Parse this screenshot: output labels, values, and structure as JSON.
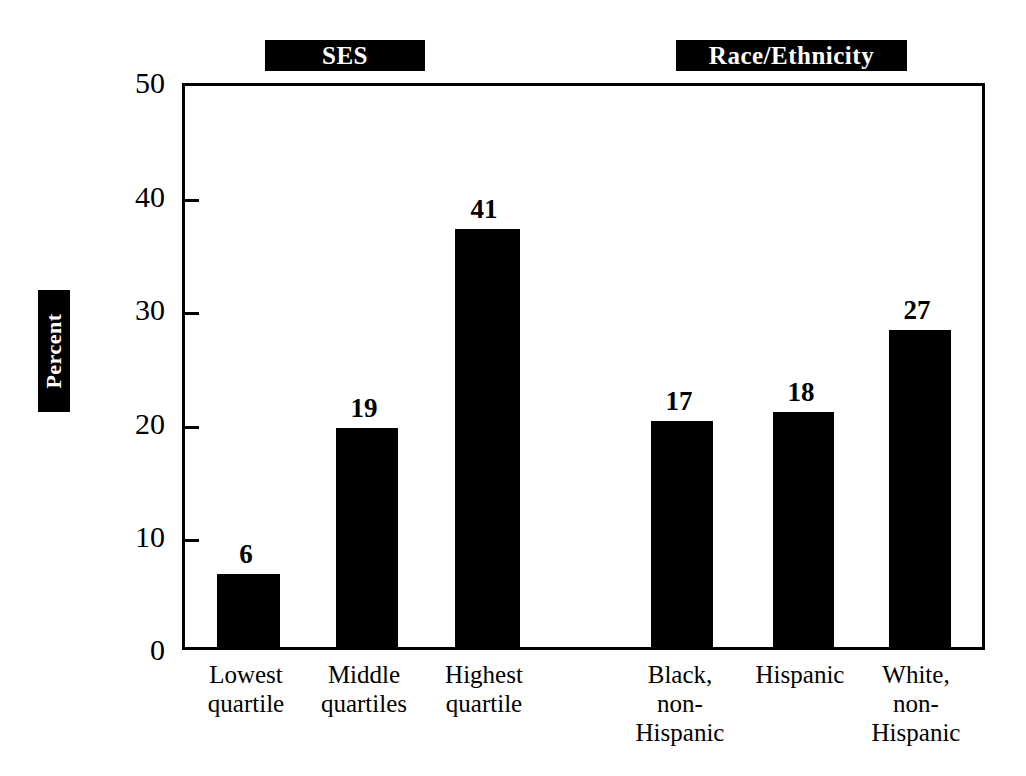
{
  "chart_data": {
    "type": "bar",
    "title": "",
    "xlabel": "",
    "ylabel": "Percent",
    "ylim": [
      0,
      50
    ],
    "yticks": [
      0,
      10,
      20,
      30,
      40,
      50
    ],
    "grid": false,
    "legend_position": "none",
    "group_headers": [
      {
        "label": "SES"
      },
      {
        "label": "Race/Ethnicity"
      }
    ],
    "categories": [
      "Lowest quartile",
      "Middle quartiles",
      "Highest quartile",
      "Black, non-Hispanic",
      "Hispanic",
      "White, non-Hispanic"
    ],
    "category_lines": [
      [
        "Lowest",
        "quartile"
      ],
      [
        "Middle",
        "quartiles"
      ],
      [
        "Highest",
        "quartile"
      ],
      [
        "Black,",
        "non-",
        "Hispanic"
      ],
      [
        "Hispanic"
      ],
      [
        "White,",
        "non-",
        "Hispanic"
      ]
    ],
    "values": [
      6,
      19,
      41,
      17,
      18,
      27
    ],
    "value_labels": [
      "6",
      "19",
      "41",
      "17",
      "18",
      "27"
    ],
    "bar_color": "#000000",
    "bars": [
      {
        "label": "Lowest quartile",
        "value": 6,
        "value_label": "6",
        "x": 214,
        "width": 63,
        "top": 577,
        "label_x": 205,
        "label_width": 82,
        "label_top": 541
      },
      {
        "label": "Middle quartiles",
        "value": 19,
        "value_label": "19",
        "x": 333,
        "width": 62,
        "top": 431,
        "label_x": 323,
        "label_width": 82,
        "label_top": 395
      },
      {
        "label": "Highest quartile",
        "value": 41,
        "value_label": "41",
        "x": 452,
        "width": 65,
        "top": 232,
        "label_x": 443,
        "label_width": 82,
        "label_top": 196
      },
      {
        "label": "Black, non-Hispanic",
        "value": 17,
        "value_label": "17",
        "x": 648,
        "width": 62,
        "top": 424,
        "label_x": 638,
        "label_width": 82,
        "label_top": 388
      },
      {
        "label": "Hispanic",
        "value": 18,
        "value_label": "18",
        "x": 770,
        "width": 61,
        "top": 415,
        "label_x": 760,
        "label_width": 82,
        "label_top": 379
      },
      {
        "label": "White, non-Hispanic",
        "value": 27,
        "value_label": "27",
        "x": 886,
        "width": 62,
        "top": 333,
        "label_x": 876,
        "label_width": 82,
        "label_top": 297
      }
    ],
    "ytick_positions": [
      {
        "label": "50",
        "y": 83
      },
      {
        "label": "40",
        "y": 197
      },
      {
        "label": "30",
        "y": 310
      },
      {
        "label": "20",
        "y": 424
      },
      {
        "label": "10",
        "y": 537
      },
      {
        "label": "0",
        "y": 650
      }
    ],
    "category_positions": [
      {
        "x": 170,
        "width": 152
      },
      {
        "x": 288,
        "width": 152
      },
      {
        "x": 408,
        "width": 152
      },
      {
        "x": 604,
        "width": 152
      },
      {
        "x": 724,
        "width": 152
      },
      {
        "x": 840,
        "width": 152
      }
    ]
  }
}
